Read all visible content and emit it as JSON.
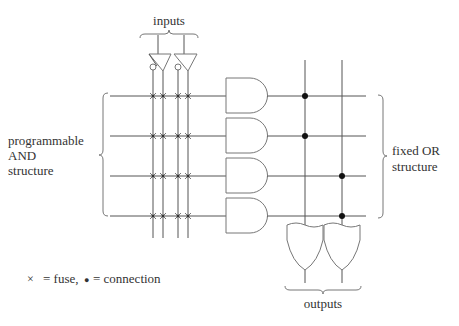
{
  "labels": {
    "inputs": "inputs",
    "and_structure": [
      "programmable",
      "AND",
      "structure"
    ],
    "or_structure": [
      "fixed OR",
      "structure"
    ],
    "outputs": "outputs"
  },
  "legend": {
    "fuse_symbol": "×",
    "fuse_text": "= fuse,",
    "connection_symbol": "●",
    "connection_text": "= connection"
  },
  "structure": {
    "inputs": 2,
    "input_lines": 4,
    "and_gates": 4,
    "or_gates": 2,
    "fuses": "all 16 crossings (4 product rows × 4 input lines)",
    "connections": [
      {
        "and_gate": 1,
        "or_gate": 1
      },
      {
        "and_gate": 2,
        "or_gate": 1
      },
      {
        "and_gate": 3,
        "or_gate": 2
      },
      {
        "and_gate": 4,
        "or_gate": 2
      }
    ]
  }
}
